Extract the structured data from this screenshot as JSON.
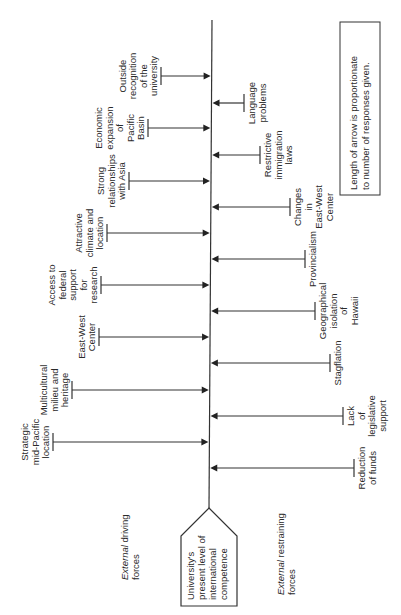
{
  "diagram": {
    "type": "force-field-analysis",
    "orientation": "rotated-90-ccw",
    "legend": {
      "lines": [
        "Length of arrow is proportionate",
        "to number of responses given."
      ]
    },
    "center": {
      "lines": [
        "University's",
        "present level of",
        "international",
        "competence"
      ]
    },
    "driving_label": {
      "italic": "External",
      "rest": " driving",
      "line2": "forces"
    },
    "restraining_label": {
      "italic": "External",
      "rest": " restraining",
      "line2": "forces"
    },
    "driving_forces": [
      {
        "name": "Outside recognition of the university",
        "lines": [
          "Outside",
          "recognition",
          "of the",
          "university"
        ],
        "y": 76,
        "x_start": 161
      },
      {
        "name": "Economic expansion of Pacific Basin",
        "lines": [
          "Economic",
          "expansion",
          "of",
          "Pacific",
          "Basin"
        ],
        "y": 128,
        "x_start": 148
      },
      {
        "name": "Strong relationships with Asia",
        "lines": [
          "Strong",
          "relationships",
          "with Asia"
        ],
        "y": 181,
        "x_start": 129
      },
      {
        "name": "Attractive climate and location",
        "lines": [
          "Attractive",
          "climate and",
          "location"
        ],
        "y": 233,
        "x_start": 107
      },
      {
        "name": "Access to federal support for research",
        "lines": [
          "Access to",
          "federal",
          "support",
          "for",
          "research"
        ],
        "y": 285,
        "x_start": 101
      },
      {
        "name": "East-West Center",
        "lines": [
          "East-West",
          "Center"
        ],
        "y": 337,
        "x_start": 99
      },
      {
        "name": "Multicultural milieu and heritage",
        "lines": [
          "Multicultural",
          "milieu and",
          "heritage"
        ],
        "y": 390,
        "x_start": 72
      },
      {
        "name": "Strategic mid-Pacific location",
        "lines": [
          "Strategic",
          "mid-Pacific",
          "location"
        ],
        "y": 442,
        "x_start": 53
      }
    ],
    "restraining_forces": [
      {
        "name": "Language problems",
        "lines": [
          "Language",
          "problems"
        ],
        "y": 103,
        "x_end": 244
      },
      {
        "name": "Restrictive immigration laws",
        "lines": [
          "Restrictive",
          "immigration",
          "laws"
        ],
        "y": 155,
        "x_end": 260
      },
      {
        "name": "Changes in East-West Center",
        "lines": [
          "Changes",
          "in",
          "East-West",
          "Center"
        ],
        "y": 207,
        "x_end": 290
      },
      {
        "name": "Provincialism",
        "lines": [
          "Provincialism"
        ],
        "y": 259,
        "x_end": 305
      },
      {
        "name": "Geographical isolation of Hawaii",
        "lines": [
          "Geographical",
          "isolation",
          "of",
          "Hawaii"
        ],
        "y": 311,
        "x_end": 315
      },
      {
        "name": "Stagflation",
        "lines": [
          "Stagflation"
        ],
        "y": 363,
        "x_end": 330
      },
      {
        "name": "Lack of legislative support",
        "lines": [
          "Lack",
          "of",
          "legislative",
          "support"
        ],
        "y": 416,
        "x_end": 343
      },
      {
        "name": "Reduction of funds",
        "lines": [
          "Reduction",
          "of funds"
        ],
        "y": 468,
        "x_end": 354
      }
    ]
  }
}
